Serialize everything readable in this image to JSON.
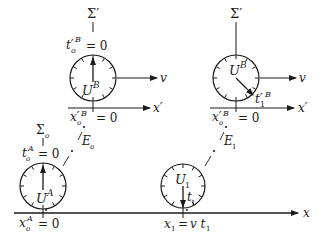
{
  "diagram": {
    "type": "spacetime-clock-synchronization",
    "frames": {
      "moving": "Σ'",
      "rest": "Σo"
    },
    "clocks": [
      {
        "id": "UB-initial",
        "label_base": "U",
        "label_sup": "B",
        "frame": "Σ'",
        "time_base": "t'",
        "time_sub": "o",
        "time_sup": "B",
        "time_value": "= 0",
        "position_base": "x'",
        "position_sub": "o",
        "position_sup": "B",
        "position_value": "= 0",
        "velocity": "v",
        "axis": "x'"
      },
      {
        "id": "UB-later",
        "label_base": "U",
        "label_sup": "B",
        "frame": "Σ'",
        "time_base": "t'",
        "time_sub": "1",
        "time_sup": "B",
        "position_base": "x'",
        "position_sub": "o",
        "position_sup": "B",
        "position_value": "= 0",
        "velocity": "v",
        "axis": "x'"
      },
      {
        "id": "UA",
        "label_base": "U",
        "label_sup": "A",
        "frame": "Σo",
        "time_base": "t",
        "time_sub": "o",
        "time_sup": "A",
        "time_value": "= 0",
        "position_base": "x",
        "position_sub": "o",
        "position_sup": "A",
        "position_value": "= 0",
        "axis": "x"
      },
      {
        "id": "U1",
        "label_base": "U",
        "label_sub": "1",
        "time_base": "t",
        "time_sub": "1",
        "position_base": "x",
        "position_sub": "1",
        "position_value": "= v t",
        "position_value_sub": "1",
        "axis": "x"
      }
    ],
    "events": [
      {
        "base": "E",
        "sub": "o"
      },
      {
        "base": "E",
        "sub": "1"
      }
    ],
    "labels": {
      "sigma_prime": "Σ′",
      "sigma": "Σ",
      "sigma_sub": "o",
      "U": "U",
      "A": "A",
      "B": "B",
      "t": "t",
      "tprime": "t′",
      "x": "x",
      "xprime": "x′",
      "v": "v",
      "E": "E",
      "o": "o",
      "one": "1",
      "eq0": "= 0",
      "eq": "=",
      "vt": "v t"
    }
  }
}
